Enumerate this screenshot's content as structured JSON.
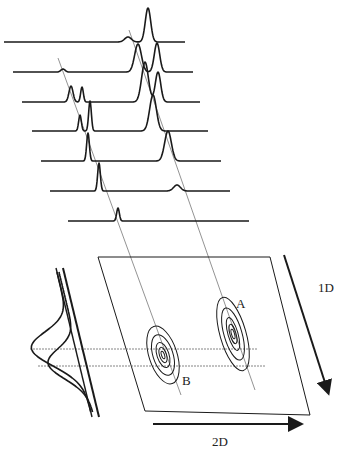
{
  "figure": {
    "labels": {
      "peak_a": "A",
      "peak_b": "B",
      "axis_1d": "1D",
      "axis_2d": "2D"
    },
    "colors": {
      "ink": "#1a1a1a",
      "guide": "#777777",
      "background": "#ffffff"
    }
  },
  "traces": [
    {
      "index": 1,
      "baseline_y": 42,
      "x_start": 4,
      "x_end": 185,
      "peaks": [
        {
          "x": 128,
          "height": 5,
          "width": 5
        },
        {
          "x": 148,
          "height": 34,
          "width": 4
        }
      ]
    },
    {
      "index": 2,
      "baseline_y": 72,
      "x_start": 13,
      "x_end": 193,
      "peaks": [
        {
          "x": 63,
          "height": 3,
          "width": 3
        },
        {
          "x": 138,
          "height": 28,
          "width": 5
        },
        {
          "x": 157,
          "height": 29,
          "width": 4
        }
      ]
    },
    {
      "index": 3,
      "baseline_y": 102,
      "x_start": 22,
      "x_end": 200,
      "peaks": [
        {
          "x": 71,
          "height": 16,
          "width": 3
        },
        {
          "x": 82,
          "height": 15,
          "width": 2
        },
        {
          "x": 145,
          "height": 40,
          "width": 5
        },
        {
          "x": 158,
          "height": 30,
          "width": 4
        }
      ]
    },
    {
      "index": 4,
      "baseline_y": 131,
      "x_start": 32,
      "x_end": 208,
      "peaks": [
        {
          "x": 80,
          "height": 16,
          "width": 2
        },
        {
          "x": 90,
          "height": 30,
          "width": 2
        },
        {
          "x": 153,
          "height": 36,
          "width": 5
        }
      ]
    },
    {
      "index": 5,
      "baseline_y": 161,
      "x_start": 41,
      "x_end": 221,
      "peaks": [
        {
          "x": 88,
          "height": 28,
          "width": 2
        },
        {
          "x": 168,
          "height": 30,
          "width": 5
        }
      ]
    },
    {
      "index": 6,
      "baseline_y": 191,
      "x_start": 50,
      "x_end": 230,
      "peaks": [
        {
          "x": 99,
          "height": 28,
          "width": 2
        },
        {
          "x": 177,
          "height": 6,
          "width": 5
        }
      ]
    },
    {
      "index": 7,
      "baseline_y": 221,
      "x_start": 68,
      "x_end": 249,
      "peaks": [
        {
          "x": 118,
          "height": 13,
          "width": 2
        }
      ]
    }
  ],
  "guides": [
    {
      "name": "compound-b-guide",
      "x1": 58,
      "y1": 58,
      "x2": 181,
      "y2": 395
    },
    {
      "name": "compound-a-guide",
      "x1": 129,
      "y1": 30,
      "x2": 255,
      "y2": 390
    }
  ],
  "plane": {
    "points": "98,257 270,257 310,415 145,411"
  },
  "contours": {
    "A": {
      "cx": 233,
      "cy": 334,
      "rings": [
        [
          13,
          38
        ],
        [
          9,
          27
        ],
        [
          5,
          17
        ],
        [
          3,
          10
        ],
        [
          1.5,
          5
        ]
      ],
      "rotate": -16,
      "label_x": 236,
      "label_y": 308
    },
    "B": {
      "cx": 163,
      "cy": 355,
      "rings": [
        [
          14,
          30
        ],
        [
          10,
          21
        ],
        [
          6,
          13
        ],
        [
          3.5,
          8
        ],
        [
          1.5,
          4
        ]
      ],
      "rotate": -18,
      "label_x": 182,
      "label_y": 385
    }
  },
  "projection_lines": [
    {
      "y": 349,
      "x1": 30,
      "x2": 258
    },
    {
      "y": 366,
      "x1": 38,
      "x2": 266
    }
  ],
  "side_projection": {
    "axis_lines": [
      {
        "x1": 56,
        "y1": 268,
        "x2": 92,
        "y2": 417
      },
      {
        "x1": 63,
        "y1": 268,
        "x2": 99,
        "y2": 417
      }
    ]
  },
  "arrows": {
    "dim1": {
      "x1": 284,
      "y1": 255,
      "x2": 328,
      "y2": 392,
      "label_x": 318,
      "label_y": 292
    },
    "dim2": {
      "x1": 153,
      "y1": 424,
      "x2": 300,
      "y2": 424,
      "label_x": 212,
      "label_y": 446
    }
  }
}
